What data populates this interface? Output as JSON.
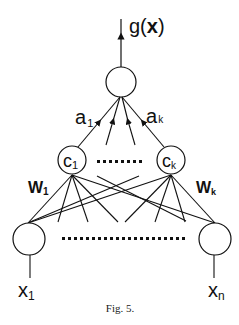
{
  "diagram": {
    "output_label": {
      "base": "g(",
      "bold": "x",
      "close": ")"
    },
    "output_node": {
      "label": ""
    },
    "edge_labels": {
      "a_first": {
        "base": "a",
        "sub": "1"
      },
      "a_last": {
        "base": "a",
        "sub": "k"
      }
    },
    "hidden_nodes": [
      {
        "base": "c",
        "sub": "1"
      },
      {
        "base": "c",
        "sub": "k"
      }
    ],
    "weight_labels": [
      {
        "base": "W",
        "sub": "1"
      },
      {
        "base": "W",
        "sub": "k"
      }
    ],
    "input_nodes": [
      {
        "base": "x",
        "sub": "1"
      },
      {
        "base": "x",
        "sub": "n"
      }
    ],
    "caption": "Fig. 5."
  },
  "colors": {
    "stroke": "#111111",
    "background": "#ffffff"
  }
}
